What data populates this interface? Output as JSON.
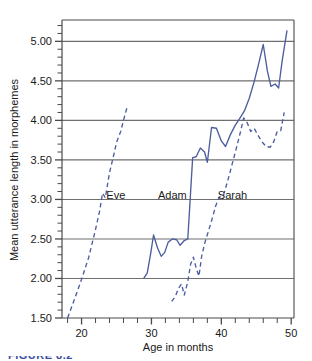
{
  "figure": {
    "caption_partial": "FIGURE 8.2"
  },
  "chart_data": {
    "type": "line",
    "title": "",
    "xlabel": "Age in months",
    "ylabel": "Mean utterance length in morphemes",
    "xlim": [
      17.2,
      50.4
    ],
    "ylim": [
      1.5,
      5.27
    ],
    "grid": true,
    "grid_axis": "y",
    "legend_position": "inline-annotations",
    "x_ticks_major": [
      20,
      30,
      40,
      50
    ],
    "x_tick_labels": [
      "20",
      "30",
      "40",
      "50"
    ],
    "x_tick_step_minor": 2,
    "y_ticks_major": [
      1.5,
      2.0,
      2.5,
      3.0,
      3.5,
      4.0,
      4.5,
      5.0
    ],
    "y_tick_labels": [
      "1.50",
      "2.00",
      "2.50",
      "3.00",
      "3.50",
      "4.00",
      "4.50",
      "5.00"
    ],
    "y_tick_step_minor": 0.1,
    "line_color": "#4c5e9e",
    "grid_color": "#6f6f6f",
    "axis_color": "#4a4a4a",
    "annotations": [
      {
        "text": "Eve",
        "x": 24.9,
        "y": 3.06
      },
      {
        "text": "Adam",
        "x": 33.0,
        "y": 3.06
      },
      {
        "text": "Sarah",
        "x": 41.6,
        "y": 3.06
      }
    ],
    "series": [
      {
        "name": "Eve",
        "style": "dashed",
        "points": [
          {
            "x": 18.0,
            "y": 1.5
          },
          {
            "x": 18.5,
            "y": 1.62
          },
          {
            "x": 19.0,
            "y": 1.74
          },
          {
            "x": 20.0,
            "y": 1.99
          },
          {
            "x": 21.0,
            "y": 2.26
          },
          {
            "x": 22.0,
            "y": 2.62
          },
          {
            "x": 22.6,
            "y": 2.86
          },
          {
            "x": 23.0,
            "y": 3.08
          },
          {
            "x": 23.4,
            "y": 3.02
          },
          {
            "x": 24.0,
            "y": 3.34
          },
          {
            "x": 24.6,
            "y": 3.56
          },
          {
            "x": 25.0,
            "y": 3.72
          },
          {
            "x": 25.6,
            "y": 3.86
          },
          {
            "x": 26.0,
            "y": 4.0
          },
          {
            "x": 26.3,
            "y": 4.1
          },
          {
            "x": 26.6,
            "y": 4.19
          }
        ]
      },
      {
        "name": "Adam",
        "style": "solid",
        "points": [
          {
            "x": 28.9,
            "y": 2.0
          },
          {
            "x": 29.4,
            "y": 2.07
          },
          {
            "x": 29.9,
            "y": 2.32
          },
          {
            "x": 30.3,
            "y": 2.55
          },
          {
            "x": 30.9,
            "y": 2.38
          },
          {
            "x": 31.4,
            "y": 2.28
          },
          {
            "x": 31.9,
            "y": 2.33
          },
          {
            "x": 32.4,
            "y": 2.46
          },
          {
            "x": 33.0,
            "y": 2.5
          },
          {
            "x": 33.6,
            "y": 2.49
          },
          {
            "x": 34.1,
            "y": 2.42
          },
          {
            "x": 34.7,
            "y": 2.48
          },
          {
            "x": 35.2,
            "y": 2.5
          },
          {
            "x": 35.9,
            "y": 3.53
          },
          {
            "x": 36.4,
            "y": 3.54
          },
          {
            "x": 37.0,
            "y": 3.65
          },
          {
            "x": 37.6,
            "y": 3.6
          },
          {
            "x": 38.0,
            "y": 3.47
          },
          {
            "x": 38.6,
            "y": 3.91
          },
          {
            "x": 39.3,
            "y": 3.9
          },
          {
            "x": 40.0,
            "y": 3.74
          },
          {
            "x": 40.6,
            "y": 3.67
          },
          {
            "x": 41.3,
            "y": 3.82
          },
          {
            "x": 42.0,
            "y": 3.94
          },
          {
            "x": 42.6,
            "y": 4.02
          },
          {
            "x": 43.3,
            "y": 4.12
          },
          {
            "x": 44.0,
            "y": 4.28
          },
          {
            "x": 44.7,
            "y": 4.49
          },
          {
            "x": 45.3,
            "y": 4.7
          },
          {
            "x": 46.0,
            "y": 4.96
          },
          {
            "x": 46.6,
            "y": 4.62
          },
          {
            "x": 47.1,
            "y": 4.43
          },
          {
            "x": 47.7,
            "y": 4.46
          },
          {
            "x": 48.2,
            "y": 4.41
          },
          {
            "x": 48.7,
            "y": 4.75
          },
          {
            "x": 49.4,
            "y": 5.14
          }
        ]
      },
      {
        "name": "Sarah",
        "style": "dashed",
        "points": [
          {
            "x": 32.9,
            "y": 1.71
          },
          {
            "x": 33.4,
            "y": 1.77
          },
          {
            "x": 33.9,
            "y": 1.88
          },
          {
            "x": 34.3,
            "y": 1.93
          },
          {
            "x": 34.7,
            "y": 1.79
          },
          {
            "x": 35.2,
            "y": 1.96
          },
          {
            "x": 35.6,
            "y": 2.18
          },
          {
            "x": 36.0,
            "y": 2.27
          },
          {
            "x": 36.4,
            "y": 2.13
          },
          {
            "x": 36.8,
            "y": 2.03
          },
          {
            "x": 37.2,
            "y": 2.29
          },
          {
            "x": 37.7,
            "y": 2.47
          },
          {
            "x": 38.2,
            "y": 2.61
          },
          {
            "x": 38.7,
            "y": 2.76
          },
          {
            "x": 39.2,
            "y": 2.92
          },
          {
            "x": 39.7,
            "y": 3.03
          },
          {
            "x": 40.3,
            "y": 3.05
          },
          {
            "x": 40.9,
            "y": 3.23
          },
          {
            "x": 41.5,
            "y": 3.43
          },
          {
            "x": 42.1,
            "y": 3.63
          },
          {
            "x": 42.7,
            "y": 3.84
          },
          {
            "x": 43.2,
            "y": 4.03
          },
          {
            "x": 43.7,
            "y": 3.97
          },
          {
            "x": 44.2,
            "y": 3.86
          },
          {
            "x": 44.7,
            "y": 3.9
          },
          {
            "x": 45.2,
            "y": 3.82
          },
          {
            "x": 45.8,
            "y": 3.73
          },
          {
            "x": 46.4,
            "y": 3.67
          },
          {
            "x": 47.0,
            "y": 3.66
          },
          {
            "x": 47.5,
            "y": 3.73
          },
          {
            "x": 48.0,
            "y": 3.86
          },
          {
            "x": 48.5,
            "y": 3.87
          },
          {
            "x": 49.0,
            "y": 4.1
          }
        ]
      }
    ]
  }
}
